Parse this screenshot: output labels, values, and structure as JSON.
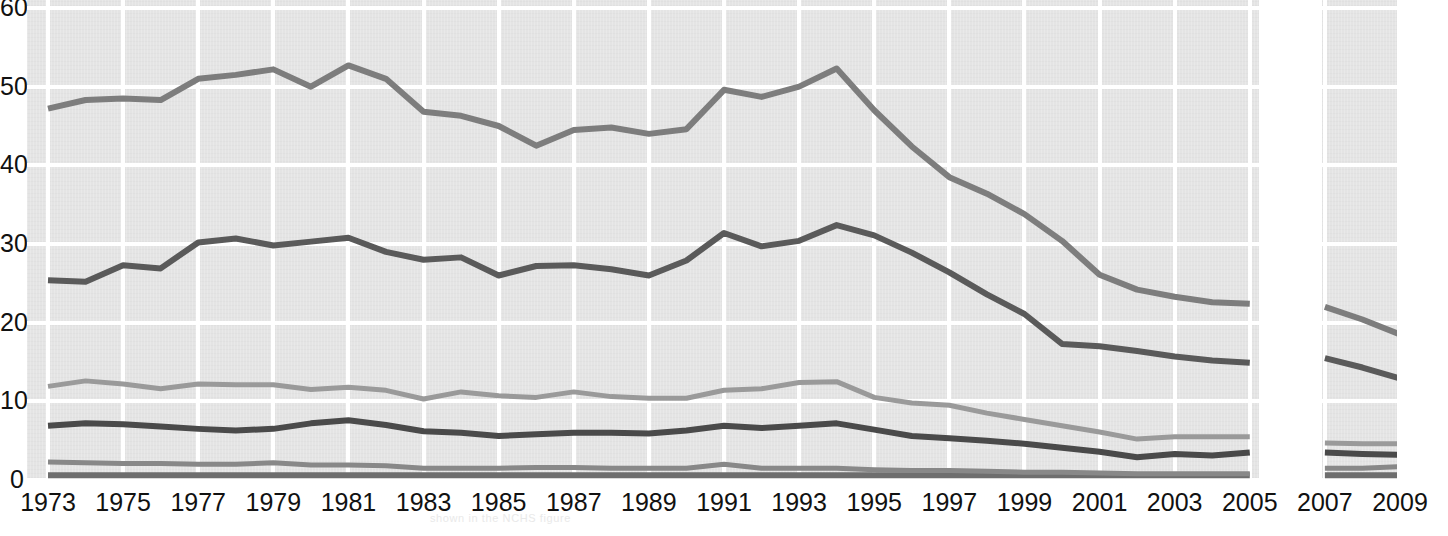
{
  "chart_data": {
    "type": "line",
    "title": "",
    "subtitle": "",
    "xlabel": "",
    "ylabel": "",
    "xlim": [
      1973,
      2009
    ],
    "ylim": [
      0,
      60
    ],
    "grid": true,
    "legend_position": "none",
    "y_ticks": [
      "0",
      "10",
      "20",
      "30",
      "40",
      "50",
      "60"
    ],
    "y_tick_values": [
      0,
      10,
      20,
      30,
      40,
      50,
      60
    ],
    "x_ticks": [
      "1973",
      "1975",
      "1977",
      "1979",
      "1981",
      "1983",
      "1985",
      "1987",
      "1989",
      "1991",
      "1993",
      "1995",
      "1997",
      "1999",
      "2001",
      "2003",
      "2005",
      "2007",
      "2009"
    ],
    "x_tick_values": [
      1973,
      1975,
      1977,
      1979,
      1981,
      1983,
      1985,
      1987,
      1989,
      1991,
      1993,
      1995,
      1997,
      1999,
      2001,
      2003,
      2005,
      2007,
      2009
    ],
    "note": "Data break between 2005 and 2007; no values plotted in the gap.",
    "x": [
      1973,
      1974,
      1975,
      1976,
      1977,
      1978,
      1979,
      1980,
      1981,
      1982,
      1983,
      1984,
      1985,
      1986,
      1987,
      1988,
      1989,
      1990,
      1991,
      1992,
      1993,
      1994,
      1995,
      1996,
      1997,
      1998,
      1999,
      2000,
      2001,
      2002,
      2003,
      2004,
      2005
    ],
    "x_segment2": [
      2007,
      2008,
      2009
    ],
    "series": [
      {
        "name": "series-1",
        "color": "#7d7d7d",
        "width": 6,
        "values": [
          47.2,
          48.3,
          48.5,
          48.3,
          51.0,
          51.5,
          52.2,
          50.0,
          52.7,
          51.0,
          46.8,
          46.3,
          45.0,
          42.5,
          44.5,
          44.8,
          44.0,
          44.6,
          49.6,
          48.7,
          50.0,
          52.3,
          47.0,
          42.4,
          38.5,
          36.4,
          33.8,
          30.4,
          26.1,
          24.2,
          23.3,
          22.6,
          22.4
        ],
        "values_segment2": [
          22.0,
          20.4,
          18.5
        ]
      },
      {
        "name": "series-2",
        "color": "#5a5a5a",
        "width": 6,
        "values": [
          25.4,
          25.2,
          27.3,
          26.9,
          30.2,
          30.7,
          29.8,
          30.3,
          30.8,
          29.0,
          28.0,
          28.3,
          26.0,
          27.2,
          27.3,
          26.8,
          26.0,
          27.9,
          31.4,
          29.7,
          30.4,
          32.4,
          31.1,
          28.9,
          26.4,
          23.6,
          21.1,
          17.3,
          17.0,
          16.4,
          15.7,
          15.2,
          14.9
        ],
        "values_segment2": [
          15.5,
          14.3,
          12.9
        ]
      },
      {
        "name": "series-3",
        "color": "#9a9a9a",
        "width": 5,
        "values": [
          11.9,
          12.6,
          12.2,
          11.6,
          12.2,
          12.1,
          12.1,
          11.5,
          11.8,
          11.4,
          10.3,
          11.2,
          10.7,
          10.5,
          11.2,
          10.6,
          10.4,
          10.4,
          11.4,
          11.6,
          12.4,
          12.5,
          10.5,
          9.8,
          9.5,
          8.5,
          7.7,
          6.9,
          6.1,
          5.2,
          5.5,
          5.5,
          5.5
        ],
        "values_segment2": [
          4.7,
          4.6,
          4.6
        ]
      },
      {
        "name": "series-4",
        "color": "#4a4a4a",
        "width": 6,
        "values": [
          6.9,
          7.2,
          7.1,
          6.8,
          6.5,
          6.3,
          6.5,
          7.2,
          7.6,
          7.0,
          6.2,
          6.0,
          5.6,
          5.8,
          6.0,
          6.0,
          5.9,
          6.3,
          6.9,
          6.6,
          6.9,
          7.2,
          6.4,
          5.6,
          5.3,
          5.0,
          4.6,
          4.1,
          3.6,
          2.9,
          3.3,
          3.1,
          3.5
        ],
        "values_segment2": [
          3.5,
          3.3,
          3.2
        ]
      },
      {
        "name": "series-5",
        "color": "#888888",
        "width": 5,
        "values": [
          2.3,
          2.2,
          2.1,
          2.1,
          2.0,
          2.0,
          2.2,
          1.9,
          1.9,
          1.8,
          1.5,
          1.5,
          1.5,
          1.6,
          1.6,
          1.5,
          1.5,
          1.5,
          2.0,
          1.5,
          1.5,
          1.5,
          1.3,
          1.2,
          1.2,
          1.1,
          1.0,
          1.0,
          0.9,
          0.8,
          0.8,
          0.8,
          0.8
        ],
        "values_segment2": [
          1.5,
          1.5,
          1.7
        ]
      },
      {
        "name": "series-6",
        "color": "#6e6e6e",
        "width": 6,
        "values": [
          0.6,
          0.6,
          0.6,
          0.6,
          0.6,
          0.6,
          0.6,
          0.6,
          0.6,
          0.6,
          0.6,
          0.6,
          0.6,
          0.6,
          0.6,
          0.6,
          0.6,
          0.6,
          0.6,
          0.6,
          0.6,
          0.6,
          0.6,
          0.6,
          0.6,
          0.6,
          0.6,
          0.6,
          0.6,
          0.6,
          0.6,
          0.6,
          0.6
        ],
        "values_segment2": [
          0.6,
          0.6,
          0.6
        ]
      }
    ]
  },
  "axis": {
    "y_labels": [
      "60",
      "50",
      "40",
      "30",
      "20",
      "10",
      "0"
    ],
    "x_labels": [
      "1973",
      "1975",
      "1977",
      "1979",
      "1981",
      "1983",
      "1985",
      "1987",
      "1989",
      "1991",
      "1993",
      "1995",
      "1997",
      "1999",
      "2001",
      "2003",
      "2005",
      "2007",
      "2009"
    ]
  },
  "footer": {
    "bleed_text": "shown in the NCHS figure"
  },
  "colors": {
    "plot_background": "#e4e4e4",
    "gridline": "#ffffff",
    "page_background": "#ffffff",
    "text": "#111111"
  }
}
